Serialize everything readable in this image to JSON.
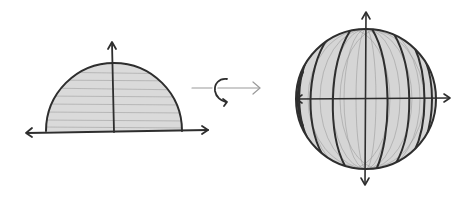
{
  "diagram": {
    "left_figure": {
      "name": "semicircle",
      "fill": "#d9d9d9",
      "stroke": "#2e2e2e",
      "axes": [
        "horizontal-axis",
        "vertical-axis"
      ]
    },
    "transition": {
      "name": "rotation",
      "arrow_color": "#9a9a9a",
      "rotation_symbol": "curved-arrow"
    },
    "right_figure": {
      "name": "sphere",
      "fill": "#d4d4d4",
      "stroke": "#3a3a3a",
      "cross_section_rings": 9,
      "axes": [
        "horizontal-axis",
        "vertical-axis"
      ]
    }
  }
}
